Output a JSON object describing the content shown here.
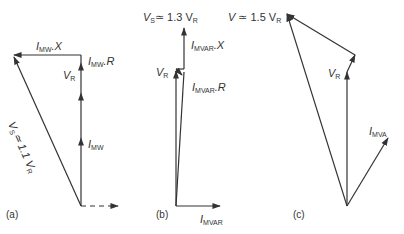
{
  "diagram": {
    "type": "phasor_diagrams",
    "panels": [
      {
        "id": "a",
        "caption": "(a)",
        "labels": {
          "imw_x": {
            "sym": "I",
            "sub": "MW",
            "rest": ".X"
          },
          "imw_r": {
            "sym": "I",
            "sub": "MW",
            "rest": ".R"
          },
          "vr": {
            "sym": "V",
            "sub": "R",
            "rest": ""
          },
          "imw": {
            "sym": "I",
            "sub": "MW",
            "rest": ""
          },
          "vs": {
            "text": "V",
            "sub": "S",
            "rest": "≃ 1.1 V",
            "sub2": "R"
          }
        }
      },
      {
        "id": "b",
        "caption": "(b)",
        "labels": {
          "vs": {
            "sym": "V",
            "sub": "S",
            "rest": "≃ 1.3 V",
            "sub2": "R"
          },
          "imvar_x": {
            "sym": "I",
            "sub": "MVAR",
            "rest": ".X"
          },
          "vr": {
            "sym": "V",
            "sub": "R",
            "rest": ""
          },
          "imvar_r": {
            "sym": "I",
            "sub": "MVAR",
            "rest": ".R"
          },
          "imvar": {
            "sym": "I",
            "sub": "MVAR",
            "rest": ""
          }
        }
      },
      {
        "id": "c",
        "caption": "(c)",
        "labels": {
          "v": {
            "sym": "V",
            "rest": " ≃ 1.5 V",
            "sub2": "R"
          },
          "vr": {
            "sym": "V",
            "sub": "R",
            "rest": ""
          },
          "imva": {
            "sym": "I",
            "sub": "MVA",
            "rest": ""
          }
        }
      }
    ],
    "colors": {
      "line": "#333333",
      "text": "#333333",
      "background": "#ffffff"
    }
  }
}
